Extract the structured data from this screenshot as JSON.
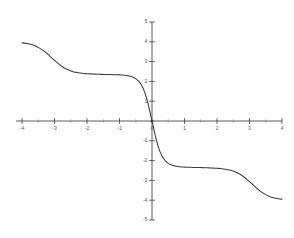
{
  "figure": {
    "background_color": "#ffffff",
    "line_color": "#3b3b3b",
    "axis_color": "#4a4a4a",
    "label_color": "#5a5a5a"
  },
  "chart_data": {
    "type": "line",
    "title": "",
    "subtitle": "",
    "xlabel": "",
    "ylabel": "",
    "xlim": [
      -4,
      4
    ],
    "ylim": [
      -5,
      5
    ],
    "grid": false,
    "legend": null,
    "legend_position": "none",
    "annotations": [],
    "x_ticks": [
      -4,
      -3,
      -2,
      -1,
      0,
      1,
      2,
      3,
      4
    ],
    "x_tick_labels": [
      "-4",
      "-3",
      "-2",
      "-1",
      "0",
      "1",
      "2",
      "3",
      "4"
    ],
    "x_minor_ticks": [
      -3.5,
      -2.5,
      -1.5,
      -0.5,
      0.5,
      1.5,
      2.5,
      3.5
    ],
    "y_ticks": [
      -5,
      -4,
      -3,
      -2,
      -1,
      0,
      1,
      2,
      3,
      4,
      5
    ],
    "y_tick_labels": [
      "-5",
      "-4",
      "-3",
      "-2",
      "-1",
      "0",
      "1",
      "2",
      "3",
      "4",
      "5"
    ],
    "y_minor_ticks": [],
    "origin_marker": true,
    "series": [
      {
        "name": "curve",
        "color": "#3b3b3b",
        "x": [
          -4.0,
          -3.9,
          -3.8,
          -3.7,
          -3.6,
          -3.5,
          -3.4,
          -3.3,
          -3.2,
          -3.1,
          -3.0,
          -2.9,
          -2.8,
          -2.7,
          -2.6,
          -2.5,
          -2.4,
          -2.3,
          -2.2,
          -2.1,
          -2.0,
          -1.9,
          -1.8,
          -1.7,
          -1.6,
          -1.5,
          -1.4,
          -1.3,
          -1.2,
          -1.1,
          -1.0,
          -0.9,
          -0.8,
          -0.7,
          -0.6,
          -0.5,
          -0.4,
          -0.35,
          -0.3,
          -0.25,
          -0.2,
          -0.15,
          -0.1,
          -0.05,
          0.0,
          0.05,
          0.1,
          0.15,
          0.2,
          0.25,
          0.3,
          0.35,
          0.4,
          0.5,
          0.6,
          0.7,
          0.8,
          0.9,
          1.0,
          1.1,
          1.2,
          1.3,
          1.4,
          1.5,
          1.6,
          1.7,
          1.8,
          1.9,
          2.0,
          2.1,
          2.2,
          2.3,
          2.4,
          2.5,
          2.6,
          2.7,
          2.8,
          2.9,
          3.0,
          3.1,
          3.2,
          3.3,
          3.4,
          3.5,
          3.6,
          3.7,
          3.8,
          3.9,
          4.0
        ],
        "y": [
          3.95,
          3.93,
          3.9,
          3.86,
          3.8,
          3.72,
          3.62,
          3.5,
          3.36,
          3.21,
          3.06,
          2.92,
          2.79,
          2.68,
          2.6,
          2.53,
          2.48,
          2.45,
          2.42,
          2.4,
          2.39,
          2.38,
          2.37,
          2.36,
          2.36,
          2.35,
          2.35,
          2.35,
          2.34,
          2.34,
          2.33,
          2.32,
          2.3,
          2.27,
          2.22,
          2.14,
          1.99,
          1.88,
          1.74,
          1.56,
          1.33,
          1.05,
          0.72,
          0.36,
          0.0,
          -0.36,
          -0.72,
          -1.05,
          -1.33,
          -1.56,
          -1.74,
          -1.88,
          -1.99,
          -2.14,
          -2.22,
          -2.27,
          -2.3,
          -2.32,
          -2.33,
          -2.34,
          -2.34,
          -2.35,
          -2.35,
          -2.35,
          -2.36,
          -2.36,
          -2.37,
          -2.38,
          -2.39,
          -2.4,
          -2.42,
          -2.45,
          -2.48,
          -2.53,
          -2.6,
          -2.68,
          -2.79,
          -2.92,
          -3.06,
          -3.21,
          -3.36,
          -3.5,
          -3.62,
          -3.72,
          -3.8,
          -3.86,
          -3.9,
          -3.93,
          -3.95
        ]
      }
    ]
  }
}
